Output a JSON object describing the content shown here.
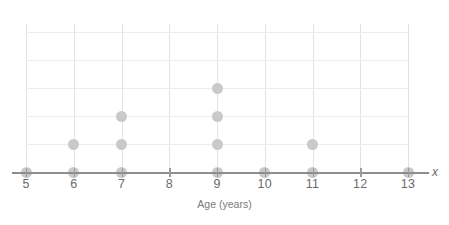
{
  "chart_data": {
    "type": "scatter",
    "plot_style": "dot-plot",
    "title": "",
    "xlabel": "Age (years)",
    "ylabel": "",
    "axis_variable_label": "x",
    "categories": [
      5,
      6,
      7,
      8,
      9,
      10,
      11,
      12,
      13
    ],
    "tick_labels": [
      "5",
      "6",
      "7",
      "8",
      "9",
      "10",
      "11",
      "12",
      "13"
    ],
    "values": [
      1,
      2,
      3,
      0,
      4,
      1,
      2,
      0,
      1
    ],
    "total_count": 14,
    "xlim": [
      5,
      13
    ],
    "ylim": [
      0,
      6
    ],
    "grid": true,
    "legend": "none",
    "series": [
      {
        "name": "Count of people",
        "values": [
          1,
          2,
          3,
          0,
          4,
          1,
          2,
          0,
          1
        ]
      }
    ],
    "points": [
      {
        "x": 5,
        "stack": 1
      },
      {
        "x": 6,
        "stack": 1
      },
      {
        "x": 6,
        "stack": 2
      },
      {
        "x": 7,
        "stack": 1
      },
      {
        "x": 7,
        "stack": 2
      },
      {
        "x": 7,
        "stack": 3
      },
      {
        "x": 9,
        "stack": 1
      },
      {
        "x": 9,
        "stack": 2
      },
      {
        "x": 9,
        "stack": 3
      },
      {
        "x": 9,
        "stack": 4
      },
      {
        "x": 10,
        "stack": 1
      },
      {
        "x": 11,
        "stack": 1
      },
      {
        "x": 11,
        "stack": 2
      },
      {
        "x": 13,
        "stack": 1
      }
    ],
    "colors": {
      "dot": "#c9c9c9",
      "axis": "#8d8d8d",
      "gridline_vertical": "#e3e3e3",
      "gridline_horizontal": "#ededed",
      "label_text": "#6b6b6b",
      "title_text": "#7a7a7a",
      "background": "#ffffff"
    },
    "geometry": {
      "plot_left": 26,
      "plot_top": 24,
      "plot_width": 382,
      "plot_height": 149,
      "tick_spacing": 47.75,
      "row_spacing": 28,
      "baseline_y": 148,
      "dot_diameter": 11,
      "grid_rows": 6
    }
  }
}
